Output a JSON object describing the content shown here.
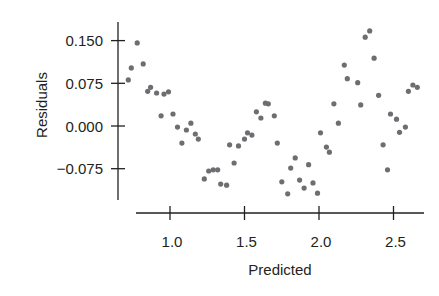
{
  "chart_data": {
    "type": "scatter",
    "title": "",
    "xlabel": "Predicted",
    "ylabel": "Residuals",
    "xlim": [
      0.69,
      2.7
    ],
    "ylim": [
      -0.13,
      0.18
    ],
    "grid": false,
    "legend": null,
    "x_ticks": [
      {
        "value": 1.0,
        "label": "1.0"
      },
      {
        "value": 1.5,
        "label": "1.5"
      },
      {
        "value": 2.0,
        "label": "2.0"
      },
      {
        "value": 2.5,
        "label": "2.5"
      }
    ],
    "y_ticks": [
      {
        "value": 0.15,
        "label": "0.150"
      },
      {
        "value": 0.075,
        "label": "0.075"
      },
      {
        "value": 0.0,
        "label": "0.000"
      },
      {
        "value": -0.075,
        "label": "−0.075"
      }
    ],
    "dot_color": "#6d6e71",
    "axis_color": "#231f20",
    "points": [
      [
        0.72,
        0.081
      ],
      [
        0.74,
        0.102
      ],
      [
        0.78,
        0.146
      ],
      [
        0.82,
        0.109
      ],
      [
        0.85,
        0.061
      ],
      [
        0.87,
        0.068
      ],
      [
        0.91,
        0.058
      ],
      [
        0.94,
        0.018
      ],
      [
        0.96,
        0.056
      ],
      [
        0.99,
        0.06
      ],
      [
        1.02,
        0.021
      ],
      [
        1.05,
        -0.002
      ],
      [
        1.08,
        -0.03
      ],
      [
        1.11,
        -0.007
      ],
      [
        1.14,
        0.005
      ],
      [
        1.17,
        -0.014
      ],
      [
        1.19,
        -0.023
      ],
      [
        1.23,
        -0.093
      ],
      [
        1.26,
        -0.079
      ],
      [
        1.29,
        -0.077
      ],
      [
        1.32,
        -0.077
      ],
      [
        1.34,
        -0.102
      ],
      [
        1.38,
        -0.104
      ],
      [
        1.4,
        -0.033
      ],
      [
        1.43,
        -0.065
      ],
      [
        1.46,
        -0.035
      ],
      [
        1.5,
        -0.023
      ],
      [
        1.52,
        -0.012
      ],
      [
        1.55,
        -0.016
      ],
      [
        1.58,
        0.025
      ],
      [
        1.61,
        0.014
      ],
      [
        1.64,
        0.04
      ],
      [
        1.66,
        0.039
      ],
      [
        1.7,
        0.018
      ],
      [
        1.72,
        -0.03
      ],
      [
        1.75,
        -0.098
      ],
      [
        1.79,
        -0.119
      ],
      [
        1.81,
        -0.074
      ],
      [
        1.84,
        -0.056
      ],
      [
        1.87,
        -0.095
      ],
      [
        1.9,
        -0.109
      ],
      [
        1.93,
        -0.068
      ],
      [
        1.96,
        -0.1
      ],
      [
        1.99,
        -0.118
      ],
      [
        2.01,
        -0.012
      ],
      [
        2.05,
        -0.037
      ],
      [
        2.07,
        -0.046
      ],
      [
        2.1,
        0.039
      ],
      [
        2.13,
        0.005
      ],
      [
        2.17,
        0.107
      ],
      [
        2.19,
        0.083
      ],
      [
        2.26,
        0.076
      ],
      [
        2.28,
        0.037
      ],
      [
        2.31,
        0.156
      ],
      [
        2.34,
        0.167
      ],
      [
        2.37,
        0.119
      ],
      [
        2.4,
        0.054
      ],
      [
        2.43,
        -0.033
      ],
      [
        2.46,
        -0.077
      ],
      [
        2.48,
        0.021
      ],
      [
        2.52,
        0.012
      ],
      [
        2.54,
        -0.011
      ],
      [
        2.58,
        -0.002
      ],
      [
        2.6,
        0.061
      ],
      [
        2.63,
        0.072
      ],
      [
        2.66,
        0.068
      ]
    ]
  }
}
